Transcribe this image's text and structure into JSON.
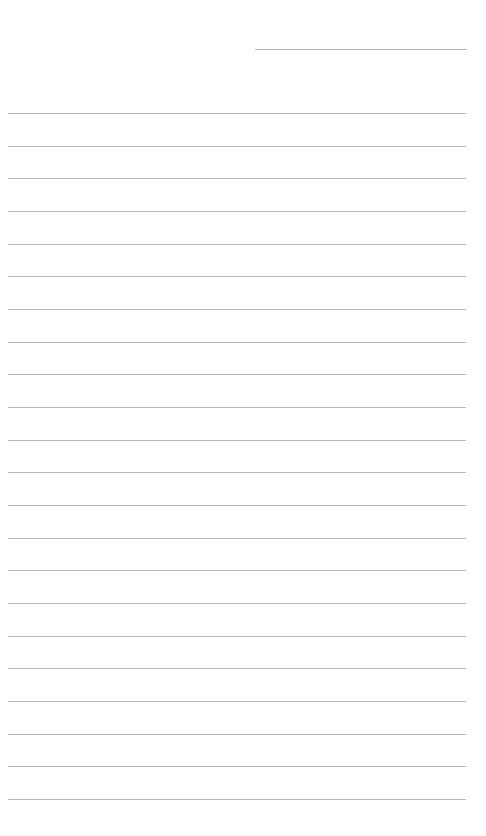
{
  "page": {
    "type": "lined-paper",
    "background_color": "#ffffff",
    "line_color": "#b8b8b8",
    "header_line": {
      "x": 255,
      "y": 49,
      "width": 212
    },
    "ruled_lines": {
      "count": 22,
      "start_y": 113,
      "spacing": 32.67,
      "x": 8,
      "width": 458
    }
  }
}
